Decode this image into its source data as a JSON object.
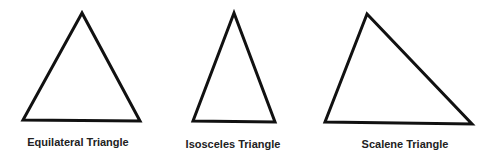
{
  "triangles": [
    {
      "name": "equilateral",
      "label": "Equilateral Triangle",
      "points": "82,13 23,120 140,121",
      "label_x": 78,
      "label_y": 136
    },
    {
      "name": "isosceles",
      "label": "Isosceles Triangle",
      "points": "234,13 193,121 275,122",
      "label_x": 233,
      "label_y": 138
    },
    {
      "name": "scalene",
      "label": "Scalene Triangle",
      "points": "367,14 325,122 472,124",
      "label_x": 405,
      "label_y": 138
    }
  ],
  "style": {
    "stroke": "#111111",
    "stroke_width": 3
  }
}
